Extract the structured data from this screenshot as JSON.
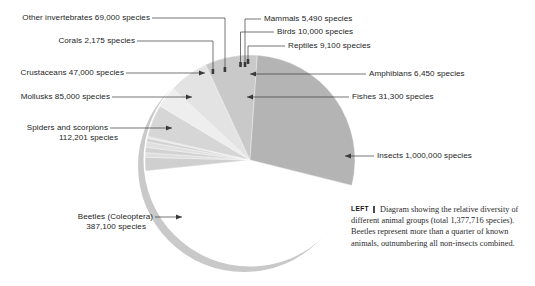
{
  "figure": {
    "title": "Relative diversity of different animal groups",
    "total_species": "1,377,716"
  },
  "caption": {
    "lead_label": "LEFT",
    "text": "Diagram showing the relative diversity of different animal groups (total 1,377,716 species). Beetles represent more than a quarter of known animals, outnumbering all non-insects combined."
  },
  "labels": {
    "other_invertebrates": "Other invertebrates 69,000 species",
    "corals": "Corals 2,175 species",
    "crustaceans": "Crustaceans 47,000 species",
    "mollusks": "Mollusks 85,000 species",
    "spiders_line1": "Spiders and scorpions",
    "spiders_line2": "112,201 species",
    "beetles_line1": "Beetles (Coleoptera)",
    "beetles_line2": "387,100 species",
    "mammals": "Mammals 5,490 species",
    "birds": "Birds  10,000 species",
    "reptiles": "Reptiles 9,100 species",
    "amphibians": "Amphibians 6,450 species",
    "fishes": "Fishes 31,300 species",
    "insects": "Insects 1,000,000 species"
  },
  "colors": {
    "background": "#ffffff",
    "leader_line": "#3a3a3a",
    "text": "#242424",
    "pie_shadow": "#c9c9c9",
    "pie_rim": "#ffffff",
    "slice_insects": "#c5c5c5",
    "slice_beetles": "#b4b4b4",
    "slice_spiders": "#c9c9c9",
    "slice_mollusks": "#e3e3e3",
    "slice_other_invertebrates": "#d6d6d6",
    "slice_crustaceans": "#eeeeee",
    "slice_fishes": "#cfcfcf",
    "slice_tiny": "#dedede"
  },
  "chart_data": {
    "type": "pie",
    "title": "Relative diversity of different animal groups",
    "units": "species",
    "total": 1377716,
    "legend": "callout labels",
    "categories": [
      "Insects",
      "Beetles (Coleoptera)",
      "Spiders and scorpions",
      "Mollusks",
      "Other invertebrates",
      "Crustaceans",
      "Fishes",
      "Birds",
      "Reptiles",
      "Amphibians",
      "Mammals",
      "Corals"
    ],
    "values": [
      1000000,
      387100,
      112201,
      85000,
      69000,
      47000,
      31300,
      10000,
      9100,
      6450,
      5490,
      2175
    ],
    "percentages": [
      72.59,
      28.1,
      8.14,
      6.17,
      5.01,
      3.41,
      2.27,
      0.73,
      0.66,
      0.47,
      0.4,
      0.16
    ]
  },
  "slices": [
    {
      "name": "Insects",
      "value": 1000000,
      "start": -96,
      "end": 62,
      "fill": "#c5c5c5"
    },
    {
      "name": "Fishes",
      "value": 31300,
      "start": -96,
      "end": -88.5,
      "fill": "#cfcfcf"
    },
    {
      "name": "Amphibians",
      "value": 6450,
      "start": -88.5,
      "end": -86,
      "fill": "#dedede"
    },
    {
      "name": "Reptiles",
      "value": 9100,
      "start": -86,
      "end": -83,
      "fill": "#d2d2d2"
    },
    {
      "name": "Birds",
      "value": 10000,
      "start": -83,
      "end": -80,
      "fill": "#e0e0e0"
    },
    {
      "name": "Mammals",
      "value": 5490,
      "start": -80,
      "end": -78,
      "fill": "#d2d2d2"
    },
    {
      "name": "Corals",
      "value": 2175,
      "start": -78,
      "end": -77,
      "fill": "#e6e6e6"
    },
    {
      "name": "Other invertebrates",
      "value": 69000,
      "start": -77,
      "end": -59,
      "fill": "#d6d6d6"
    },
    {
      "name": "Crustaceans",
      "value": 47000,
      "start": -59,
      "end": -47,
      "fill": "#eeeeee"
    },
    {
      "name": "Mollusks",
      "value": 85000,
      "start": -47,
      "end": -25,
      "fill": "#e3e3e3"
    },
    {
      "name": "Spiders and scorpions",
      "value": 112201,
      "start": -25,
      "end": 4,
      "fill": "#c9c9c9"
    },
    {
      "name": "Beetles (Coleoptera)",
      "value": 387100,
      "start": 4,
      "end": 104,
      "fill": "#b4b4b4"
    }
  ]
}
